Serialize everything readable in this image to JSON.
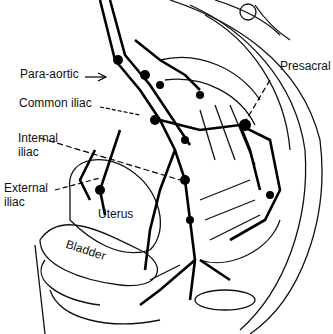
{
  "diagram": {
    "labels": {
      "para_aortic": "Para-aortic",
      "common_iliac": "Common iliac",
      "internal_iliac_1": "Internal",
      "internal_iliac_2": "iliac",
      "external_iliac_1": "External",
      "external_iliac_2": "iliac",
      "presacral": "Presacral",
      "uterus": "Uterus",
      "bladder": "Bladder"
    }
  }
}
